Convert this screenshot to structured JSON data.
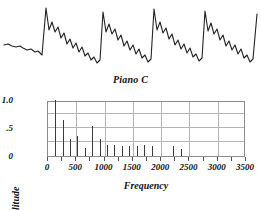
{
  "figure": {
    "waveform_caption": "Piano C"
  },
  "chart_data": {
    "type": "bar",
    "title": "Piano C",
    "xlabel": "Frequency",
    "ylabel": "Amplitude",
    "xlim": [
      0,
      3500
    ],
    "ylim": [
      0,
      1.0
    ],
    "grid": true,
    "legend": null,
    "xticks": [
      0,
      500,
      1000,
      1500,
      2000,
      2500,
      3000,
      3500
    ],
    "xtick_labels": [
      "0",
      "500",
      "1000",
      "1500",
      "2000",
      "2500",
      "3000",
      "3500"
    ],
    "yticks": [
      0,
      0.5,
      1.0
    ],
    "ytick_labels": [
      "0",
      ".5",
      "1.0"
    ],
    "x": [
      130,
      260,
      390,
      520,
      650,
      785,
      915,
      1045,
      1175,
      1305,
      1435,
      1565,
      1700,
      1830,
      2215,
      2350
    ],
    "values": [
      1.0,
      0.64,
      0.3,
      0.35,
      0.14,
      0.53,
      0.31,
      0.2,
      0.19,
      0.17,
      0.17,
      0.18,
      0.19,
      0.17,
      0.17,
      0.13
    ],
    "series": [
      {
        "name": "Piano C harmonic spectrum",
        "values": [
          1.0,
          0.64,
          0.3,
          0.35,
          0.14,
          0.53,
          0.31,
          0.2,
          0.19,
          0.17,
          0.17,
          0.18,
          0.19,
          0.17,
          0.17,
          0.13
        ]
      }
    ],
    "bar_color": "#3a3a3a",
    "frame_color": "#8c8c8c",
    "grid_color": "#b4b4b4"
  },
  "waveform": {
    "label": "Piano C",
    "stroke_color": "#222222",
    "cycles": 5,
    "points": "4,45 8,44 12,46 16,47 20,46 23,48 27,50 31,49 35,52 38,51 42,55 46,8 49,30 52,22 55,32 58,27 61,38 64,33 67,44 70,39 73,48 76,43 79,52 82,47 85,56 88,53 91,60 94,57 97,63 100,60 103,12 106,32 109,24 112,34 115,29 118,40 121,35 124,46 127,41 130,50 133,45 136,54 139,49 142,58 145,55 148,62 151,59 154,9 157,30 160,22 163,33 166,28 169,39 172,34 175,45 178,40 181,49 184,44 187,53 190,48 193,57 196,54 199,61 202,58 205,11 208,31 211,23 214,34 217,29 220,40 223,35 226,46 229,41 232,50 235,45 238,54 241,49 244,58 247,55 250,62 253,59 257,14"
  }
}
